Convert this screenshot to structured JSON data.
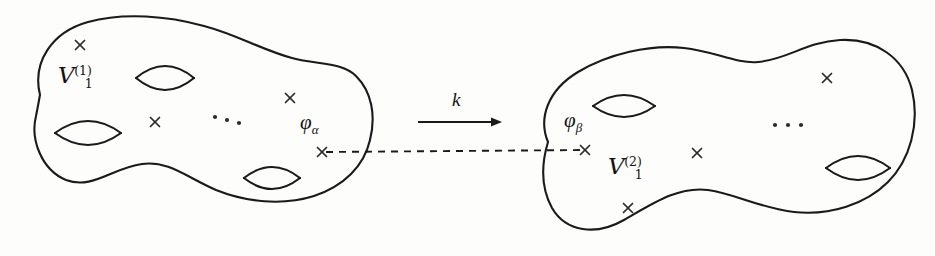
{
  "figure": {
    "background_color": "#fdfdfc",
    "ink_color": "#1a1a1a",
    "width": 935,
    "height": 256
  },
  "left_surface": {
    "name": "left-genus-surface",
    "label": "V",
    "label_superscript": "(1)",
    "label_subscript": "1",
    "label_full": "ℱ₁⁽¹⁾",
    "label_x": 58,
    "label_y": 64,
    "outline_path": "M 40 95 C 32 62 52 32 88 22 C 124 12 168 16 204 26 C 238 35 262 50 292 58 C 318 65 342 62 356 76 C 372 92 376 116 370 140 C 364 166 344 186 314 196 C 282 206 246 202 216 190 C 188 178 168 160 142 164 C 112 168 92 190 66 180 C 42 170 30 140 36 116 C 38 106 39 100 40 95 Z",
    "handles": [
      {
        "name": "handle-top",
        "cx": 165,
        "cy": 78,
        "rx": 29,
        "ry": 12
      },
      {
        "name": "handle-left",
        "cx": 88,
        "cy": 133,
        "rx": 33,
        "ry": 12
      },
      {
        "name": "handle-bottom",
        "cx": 272,
        "cy": 178,
        "rx": 28,
        "ry": 11
      }
    ],
    "punctures": [
      {
        "name": "puncture-upper-left",
        "x": 80,
        "y": 45,
        "size": 9
      },
      {
        "name": "puncture-middle",
        "x": 155,
        "y": 122,
        "size": 9
      },
      {
        "name": "puncture-upper-right",
        "x": 290,
        "y": 98,
        "size": 9
      },
      {
        "name": "puncture-phi-alpha",
        "x": 322,
        "y": 152,
        "size": 9
      }
    ],
    "ellipsis": {
      "name": "ellipsis-left",
      "x": 215,
      "y": 117,
      "count": 3,
      "spacing": 12,
      "slope": 3
    },
    "phi_label": {
      "name": "phi-alpha-label",
      "base": "φ",
      "subscript": "α",
      "text": "φₐ",
      "x": 300,
      "y": 112
    }
  },
  "right_surface": {
    "name": "right-genus-surface",
    "label": "V",
    "label_superscript": "(2)",
    "label_subscript": "1",
    "label_full": "ℱ₁⁽²⁾",
    "label_x": 608,
    "label_y": 155,
    "outline_path": "M 548 142 C 538 118 548 90 578 72 C 608 54 650 44 684 48 C 714 51 736 64 758 62 C 786 60 806 42 840 40 C 876 38 904 58 912 90 C 920 124 910 160 888 182 C 866 204 830 216 794 212 C 760 208 736 194 708 190 C 678 186 652 204 624 220 C 596 236 566 232 552 208 C 540 186 542 162 548 142 Z",
    "handles": [
      {
        "name": "handle-left",
        "cx": 624,
        "cy": 106,
        "rx": 31,
        "ry": 11
      },
      {
        "name": "handle-right",
        "cx": 858,
        "cy": 168,
        "rx": 32,
        "ry": 12
      }
    ],
    "punctures": [
      {
        "name": "puncture-upper-right",
        "x": 827,
        "y": 78,
        "size": 9
      },
      {
        "name": "puncture-middle",
        "x": 697,
        "y": 153,
        "size": 9
      },
      {
        "name": "puncture-lower-left",
        "x": 628,
        "y": 208,
        "size": 9
      },
      {
        "name": "puncture-phi-beta",
        "x": 585,
        "y": 150,
        "size": 9
      }
    ],
    "ellipsis": {
      "name": "ellipsis-right",
      "x": 775,
      "y": 125,
      "count": 3,
      "spacing": 13,
      "slope": 0
    },
    "phi_label": {
      "name": "phi-beta-label",
      "base": "φ",
      "subscript": "β",
      "text": "φβ",
      "x": 564,
      "y": 110
    }
  },
  "connector": {
    "name": "puncture-identification-dashed-line",
    "style": "dashed",
    "x1": 326,
    "y1": 152,
    "x2": 583,
    "y2": 150
  },
  "map_arrow": {
    "name": "map-arrow",
    "label": "k",
    "label_x": 452,
    "label_y": 90,
    "x1": 418,
    "y1": 122,
    "x2": 502,
    "y2": 122,
    "direction": "right"
  }
}
